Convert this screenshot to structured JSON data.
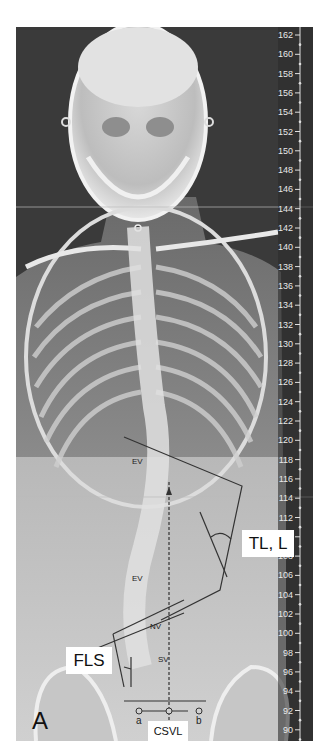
{
  "figure": {
    "panel_letter": "A",
    "labels": {
      "tl_l": "TL, L",
      "fls": "FLS",
      "csvl": "CSVL",
      "ev_upper": "EV",
      "ev_lower": "EV",
      "nv": "NV",
      "sv": "SV",
      "point_a": "a",
      "point_b": "b"
    },
    "ruler": {
      "ticks": [
        "162",
        "160",
        "158",
        "156",
        "154",
        "152",
        "150",
        "148",
        "146",
        "144",
        "142",
        "140",
        "138",
        "136",
        "134",
        "132",
        "130",
        "128",
        "126",
        "124",
        "122",
        "120",
        "118",
        "116",
        "114",
        "112",
        "110",
        "108",
        "106",
        "104",
        "102",
        "100",
        "98",
        "96",
        "94",
        "92",
        "90"
      ]
    },
    "colors": {
      "background": "#ffffff",
      "xray_dark": "#3a3a3a",
      "bone": "#e6e6e6",
      "annotation_line": "#333333",
      "label_box": "#ffffff"
    }
  }
}
